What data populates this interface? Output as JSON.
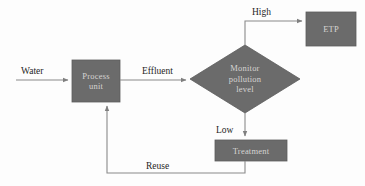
{
  "diagram": {
    "type": "flowchart",
    "background_color": "#fdfdfd",
    "node_fill_color": "#6b6b6b",
    "node_text_color": "#d6d4d2",
    "edge_color": "#8a8a8a",
    "edge_label_color": "#262626",
    "nodes": [
      {
        "id": "process_unit",
        "label": "Process\nunit",
        "line1": "Process",
        "line2": "unit",
        "shape": "rectangle"
      },
      {
        "id": "monitor",
        "label": "Monitor\npollution\nlevel",
        "line1": "Monitor",
        "line2": "pollution",
        "line3": "level",
        "shape": "diamond"
      },
      {
        "id": "etp",
        "label": "ETP",
        "shape": "rectangle"
      },
      {
        "id": "treatment",
        "label": "Treatment",
        "shape": "rectangle"
      }
    ],
    "edges": [
      {
        "id": "water",
        "label": "Water",
        "from": "input",
        "to": "process_unit"
      },
      {
        "id": "effluent",
        "label": "Effluent",
        "from": "process_unit",
        "to": "monitor"
      },
      {
        "id": "high",
        "label": "High",
        "from": "monitor",
        "to": "etp"
      },
      {
        "id": "low",
        "label": "Low",
        "from": "monitor",
        "to": "treatment"
      },
      {
        "id": "reuse",
        "label": "Reuse",
        "from": "treatment",
        "to": "process_unit"
      }
    ]
  }
}
